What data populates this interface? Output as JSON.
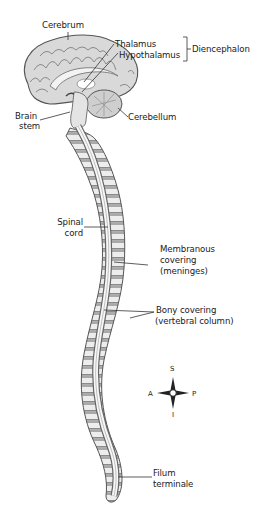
{
  "diagram": {
    "type": "anatomical-illustration",
    "labels": {
      "cerebrum": "Cerebrum",
      "thalamus": "Thalamus",
      "hypothalamus": "Hypothalamus",
      "diencephalon": "Diencephalon",
      "brain_stem_1": "Brain",
      "brain_stem_2": "stem",
      "cerebellum": "Cerebellum",
      "spinal_cord_1": "Spinal",
      "spinal_cord_2": "cord",
      "meninges_1": "Membranous",
      "meninges_2": "covering",
      "meninges_3": "(meninges)",
      "bony_1": "Bony covering",
      "bony_2": "(vertebral column)",
      "filum_1": "Filum",
      "filum_2": "terminale"
    },
    "compass": {
      "superior": "S",
      "inferior": "I",
      "anterior": "A",
      "posterior": "P"
    },
    "colors": {
      "background": "#ffffff",
      "line": "#333333",
      "text": "#1a1a1a",
      "tissue_light": "#e6e6e6",
      "tissue_mid": "#b5b5b5",
      "tissue_dark": "#777777"
    }
  }
}
